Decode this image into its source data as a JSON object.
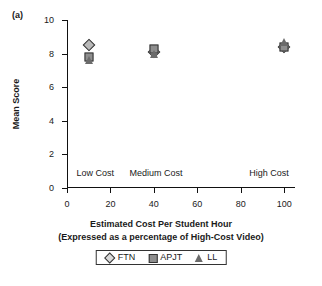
{
  "panel": {
    "label": "(a)"
  },
  "chart_data": {
    "type": "scatter",
    "title": "",
    "xlabel": "Estimated Cost Per Student Hour",
    "xlabel_line2": "(Expressed as a percentage of High-Cost Video)",
    "ylabel": "Mean Score",
    "xlim": [
      0,
      105
    ],
    "ylim": [
      0,
      10
    ],
    "xticks": [
      0,
      20,
      40,
      60,
      80,
      100
    ],
    "xtick_labels": [
      "0",
      "20",
      "40",
      "60",
      "80",
      "100"
    ],
    "yticks": [
      0,
      2,
      4,
      6,
      8,
      10
    ],
    "ytick_labels": [
      "0",
      "2",
      "4",
      "6",
      "8",
      "10"
    ],
    "grid": false,
    "legend_position": "bottom",
    "x": [
      10,
      40,
      100
    ],
    "series": [
      {
        "name": "FTN",
        "marker": "diamond",
        "color": "#b9b9b9",
        "values": [
          8.5,
          8.1,
          8.4
        ]
      },
      {
        "name": "APJT",
        "marker": "square",
        "color": "#8e8e8e",
        "values": [
          7.8,
          8.3,
          8.4
        ]
      },
      {
        "name": "LL",
        "marker": "triangle",
        "color": "#6b6b6b",
        "values": [
          7.6,
          8.0,
          8.7
        ]
      }
    ],
    "annotations": [
      {
        "text": "Low Cost",
        "x": 13,
        "y": 0.85
      },
      {
        "text": "Medium Cost",
        "x": 41,
        "y": 0.85
      },
      {
        "text": "High Cost",
        "x": 93,
        "y": 0.85
      }
    ]
  }
}
